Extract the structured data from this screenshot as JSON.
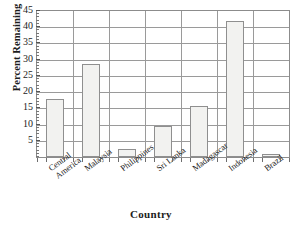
{
  "chart_data": {
    "type": "bar",
    "title": "",
    "xlabel": "Country",
    "ylabel": "Percent Remaining",
    "categories": [
      "Central America",
      "Malaysia",
      "Philippines",
      "Sri Lanka",
      "Madagascar",
      "Indonesia",
      "Brazil"
    ],
    "category_lines": [
      [
        "Central",
        "America"
      ],
      [
        "Malaysia"
      ],
      [
        "Philippines"
      ],
      [
        "Sri Lanka"
      ],
      [
        "Madagascar"
      ],
      [
        "Indonesia"
      ],
      [
        "Brazil"
      ]
    ],
    "values": [
      18,
      28.6,
      2.5,
      9.5,
      15.7,
      42,
      1
    ],
    "ylim": [
      0,
      45
    ],
    "ytick_labels": [
      "5",
      "10",
      "15",
      "20",
      "25",
      "30",
      "35",
      "40",
      "45"
    ],
    "ytick_values": [
      5,
      10,
      15,
      20,
      25,
      30,
      35,
      40,
      45
    ],
    "ytick_minor_step": 1,
    "grid": "both",
    "legend": "none",
    "bar_fill_color": "#f2f2f0",
    "bar_edge_color": "#8f8f8f",
    "axis_color": "#8c8c8c",
    "grid_color": "#9a9a9a",
    "text_color": "#1c1c1c"
  }
}
